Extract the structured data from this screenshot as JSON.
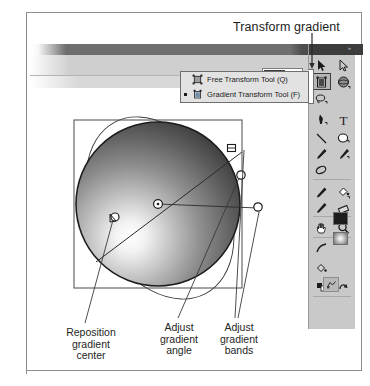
{
  "figure": {
    "domain": "Computer-Use",
    "app": "Flash Gradient Transform Tool",
    "background": "#ffffff",
    "frame_color": "#8d8d8d"
  },
  "callouts": {
    "top": {
      "label": "Transform gradient",
      "points_to": "gradient-transform-tool-button"
    }
  },
  "options_bar": {
    "zoom_value": "100%",
    "zoom_placeholder": "100%",
    "icons": [
      {
        "name": "snap-to-objects-icon"
      },
      {
        "name": "smooth-icon"
      }
    ],
    "dropdown_arrow": "chevron-down-icon"
  },
  "tool_menu": {
    "items": [
      {
        "label": "Free Transform Tool (Q)",
        "icon": "free-transform-tool-icon",
        "selected": false
      },
      {
        "label": "Gradient Transform Tool (F)",
        "icon": "gradient-transform-tool-icon",
        "selected": true
      }
    ]
  },
  "tools_panel": {
    "title_grip": "»",
    "tools": [
      {
        "name": "selection-tool-icon",
        "row": 0,
        "col": 0,
        "selected": false
      },
      {
        "name": "subselection-tool-icon",
        "row": 0,
        "col": 1,
        "selected": false
      },
      {
        "name": "gradient-transform-tool-icon",
        "row": 1,
        "col": 0,
        "selected": true
      },
      {
        "name": "3d-rotation-tool-icon",
        "row": 1,
        "col": 1,
        "selected": false
      },
      {
        "name": "lasso-tool-icon",
        "row": 2,
        "col": 0,
        "selected": false
      },
      {
        "name": "pen-tool-icon",
        "row": 3,
        "col": 0,
        "selected": false
      },
      {
        "name": "text-tool-icon",
        "row": 3,
        "col": 1,
        "selected": false
      },
      {
        "name": "line-tool-icon",
        "row": 4,
        "col": 0,
        "selected": false
      },
      {
        "name": "oval-tool-icon",
        "row": 4,
        "col": 1,
        "selected": false
      },
      {
        "name": "pencil-tool-icon",
        "row": 5,
        "col": 0,
        "selected": false
      },
      {
        "name": "brush-tool-icon",
        "row": 5,
        "col": 1,
        "selected": false
      },
      {
        "name": "deco-tool-icon",
        "row": 6,
        "col": 0,
        "selected": false
      },
      {
        "name": "bone-tool-icon",
        "row": 7,
        "col": 0,
        "selected": false
      },
      {
        "name": "paint-bucket-tool-icon",
        "row": 7,
        "col": 1,
        "selected": false
      },
      {
        "name": "eyedropper-tool-icon",
        "row": 8,
        "col": 0,
        "selected": false
      },
      {
        "name": "eraser-tool-icon",
        "row": 8,
        "col": 1,
        "selected": false
      },
      {
        "name": "hand-tool-icon",
        "row": 9,
        "col": 0,
        "selected": false
      },
      {
        "name": "zoom-tool-icon",
        "row": 9,
        "col": 1,
        "selected": false
      },
      {
        "name": "stroke-color-icon",
        "row": 10,
        "col": 0,
        "selected": false
      },
      {
        "name": "fill-color-icon",
        "row": 11,
        "col": 0,
        "selected": false
      },
      {
        "name": "black-and-white-icon",
        "row": 12,
        "col": 0,
        "selected": false
      },
      {
        "name": "swap-colors-icon",
        "row": 12,
        "col": 1,
        "selected": false
      },
      {
        "name": "snap-to-objects-option-icon",
        "row": 13,
        "col": 0,
        "selected": false
      }
    ],
    "stroke_color": "#1d1d1d",
    "fill_color": "radial-white-grey"
  },
  "stage": {
    "object": {
      "name": "gradient-filled-circle",
      "shape": "circle",
      "gradient": "radial",
      "highlight_position": "lower-left",
      "light_color": "#ffffff",
      "dark_color": "#3a3a3a"
    },
    "handles": [
      {
        "name": "center-handle",
        "type": "circle",
        "label": "Reposition gradient center"
      },
      {
        "name": "focal-point-handle",
        "type": "triangle-circle"
      },
      {
        "name": "size-handle",
        "type": "circle",
        "label": "Adjust gradient bands"
      },
      {
        "name": "rotation-handle",
        "type": "circle",
        "label": "Adjust gradient angle"
      },
      {
        "name": "width-handle",
        "type": "square"
      }
    ],
    "bounding_box": "selection-bounding-box",
    "gradient_circle_outline": "gradient-extent-ellipse"
  },
  "captions": [
    {
      "name": "caption-reposition-gradient-center",
      "text": "Reposition\ngradient\ncenter"
    },
    {
      "name": "caption-adjust-gradient-angle",
      "text": "Adjust\ngradient\nangle"
    },
    {
      "name": "caption-adjust-gradient-bands",
      "text": "Adjust\ngradient\nbands"
    }
  ]
}
